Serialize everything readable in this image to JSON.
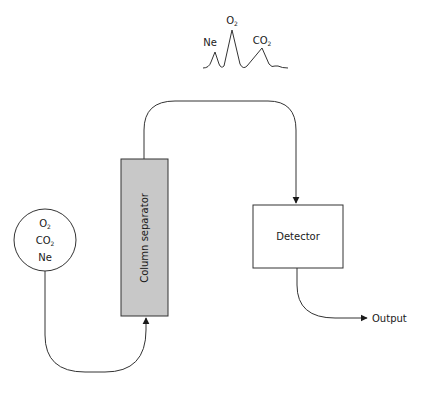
{
  "diagram": {
    "type": "gas chromatography schematic",
    "colors": {
      "line": "#333333",
      "column_fill": "#c8c8c8",
      "background": "#ffffff"
    },
    "sample": {
      "shape": "circle",
      "gases": [
        {
          "base": "O",
          "sub": "2"
        },
        {
          "base": "CO",
          "sub": "2"
        },
        {
          "base": "Ne",
          "sub": ""
        }
      ]
    },
    "column": {
      "label": "Column separator"
    },
    "detector": {
      "label": "Detector"
    },
    "output": {
      "label": "Output"
    },
    "peaks": [
      {
        "base": "Ne",
        "sub": "",
        "relative_height": "small"
      },
      {
        "base": "O",
        "sub": "2",
        "relative_height": "tall"
      },
      {
        "base": "CO",
        "sub": "2",
        "relative_height": "medium"
      }
    ],
    "flow": [
      "sample → column separator",
      "column separator → detector",
      "detector → output"
    ]
  }
}
